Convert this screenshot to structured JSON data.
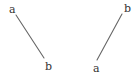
{
  "diagram": {
    "left": {
      "start_label": "a",
      "end_label": "b",
      "line": {
        "x1": 16,
        "y1": 15,
        "x2": 44,
        "y2": 58
      },
      "start_pos": {
        "x": 9,
        "y": 4
      },
      "end_pos": {
        "x": 45,
        "y": 61
      }
    },
    "right": {
      "start_label": "a",
      "end_label": "b",
      "line": {
        "x1": 97,
        "y1": 60,
        "x2": 122,
        "y2": 14
      },
      "start_pos": {
        "x": 93,
        "y": 63
      },
      "end_pos": {
        "x": 124,
        "y": 3
      }
    },
    "colors": {
      "line": "#666666",
      "text": "#333333",
      "background": "#ffffff"
    }
  }
}
